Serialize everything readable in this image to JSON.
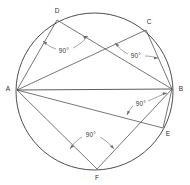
{
  "figure": {
    "stroke_color": "#4a4a4a",
    "circle_color": "#3a3a3a",
    "annotation_color": "#6a6a6a",
    "background": "#ffffff",
    "circle": {
      "cx": 94.5,
      "cy": 91.5,
      "r": 78.5
    },
    "vertices": [
      {
        "id": "A",
        "label": "A",
        "x": 17,
        "y": 90,
        "label_x": 8,
        "label_y": 89
      },
      {
        "id": "B",
        "label": "B",
        "x": 172,
        "y": 89,
        "label_x": 181,
        "label_y": 89
      },
      {
        "id": "C",
        "label": "C",
        "x": 146,
        "y": 30,
        "label_x": 149,
        "label_y": 22
      },
      {
        "id": "D",
        "label": "D",
        "x": 57,
        "y": 20,
        "label_x": 57,
        "label_y": 11
      },
      {
        "id": "E",
        "label": "E",
        "x": 163,
        "y": 128,
        "label_x": 168,
        "label_y": 134
      },
      {
        "id": "F",
        "label": "F",
        "x": 97,
        "y": 169,
        "label_x": 97,
        "label_y": 178
      }
    ],
    "segments": [
      {
        "name": "diameter-AB",
        "from": "A",
        "to": "B",
        "kind": "diameter"
      },
      {
        "name": "chord-AD",
        "from": "A",
        "to": "D",
        "kind": "chord"
      },
      {
        "name": "chord-DB",
        "from": "D",
        "to": "B",
        "kind": "chord"
      },
      {
        "name": "chord-AC",
        "from": "A",
        "to": "C",
        "kind": "chord"
      },
      {
        "name": "chord-CB",
        "from": "C",
        "to": "B",
        "kind": "chord"
      },
      {
        "name": "chord-AE",
        "from": "A",
        "to": "E",
        "kind": "chord"
      },
      {
        "name": "chord-EB",
        "from": "E",
        "to": "B",
        "kind": "chord"
      },
      {
        "name": "chord-AF",
        "from": "A",
        "to": "F",
        "kind": "chord"
      },
      {
        "name": "chord-FB",
        "from": "F",
        "to": "B",
        "kind": "chord"
      }
    ],
    "angle_labels": [
      {
        "id": "angle-at-D",
        "text": "90°",
        "x": 64,
        "y": 51,
        "vertex": "D"
      },
      {
        "id": "angle-at-C",
        "text": "90°",
        "x": 136,
        "y": 56,
        "vertex": "C"
      },
      {
        "id": "angle-at-B",
        "text": "90°",
        "x": 141,
        "y": 104,
        "vertex": "E"
      },
      {
        "id": "angle-at-F",
        "text": "90°",
        "x": 91,
        "y": 135,
        "vertex": "F"
      }
    ]
  }
}
